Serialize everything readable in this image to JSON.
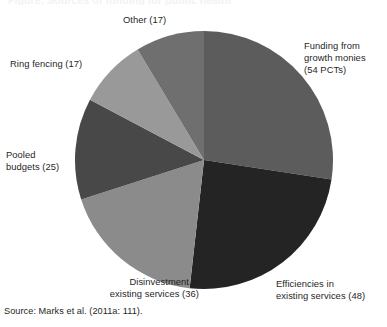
{
  "figure": {
    "cropped_caption_top": "Figure: Sources of funding for public health",
    "source_note": "Source: Marks et al. (2011a: 111)."
  },
  "chart_data": {
    "type": "pie",
    "title": "",
    "subtitle": "",
    "xlabel": "",
    "ylabel": "",
    "grid": false,
    "legend_position": "external-callout-labels",
    "total": 197,
    "unit": "PCTs",
    "start_angle_deg": 0,
    "direction": "clockwise",
    "categories": [
      "Funding from growth monies",
      "Efficiencies in existing services",
      "Disinvestment in existing services",
      "Pooled budgets",
      "Ring fencing",
      "Other"
    ],
    "values": [
      54,
      48,
      36,
      25,
      17,
      17
    ],
    "slices": [
      {
        "key": "funding-growth-monies",
        "label": "Funding from\ngrowth monies\n(54 PCTs)",
        "name": "Funding from growth monies",
        "value": 54,
        "value_text": "54 PCTs",
        "color": "#5c5c5c",
        "start_deg": 0,
        "end_deg": 98.7,
        "percent": 27.4
      },
      {
        "key": "efficiencies-existing-services",
        "label": "Efficiencies in\nexisting services (48)",
        "name": "Efficiencies in existing services",
        "value": 48,
        "value_text": "48",
        "color": "#242424",
        "start_deg": 98.7,
        "end_deg": 186.4,
        "percent": 24.4
      },
      {
        "key": "disinvestment-existing-services",
        "label": "Disinvestment in\nexisting services (36)",
        "name": "Disinvestment in existing services",
        "value": 36,
        "value_text": "36",
        "color": "#8b8b8b",
        "start_deg": 186.4,
        "end_deg": 252.2,
        "percent": 18.3
      },
      {
        "key": "pooled-budgets",
        "label": "Pooled\nbudgets (25)",
        "name": "Pooled budgets",
        "value": 25,
        "value_text": "25",
        "color": "#484848",
        "start_deg": 252.2,
        "end_deg": 297.9,
        "percent": 12.7
      },
      {
        "key": "ring-fencing",
        "label": "Ring fencing (17)",
        "name": "Ring fencing",
        "value": 17,
        "value_text": "17",
        "color": "#999999",
        "start_deg": 297.9,
        "end_deg": 329.0,
        "percent": 8.6
      },
      {
        "key": "other",
        "label": "Other (17)",
        "name": "Other",
        "value": 17,
        "value_text": "17",
        "color": "#6f6f6f",
        "start_deg": 329.0,
        "end_deg": 360.0,
        "percent": 8.6
      }
    ],
    "geometry": {
      "center_x": 130,
      "center_y": 130,
      "radius": 129
    }
  }
}
